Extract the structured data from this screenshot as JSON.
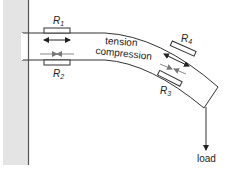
{
  "diagram": {
    "type": "cantilever-beam-strain-gauges",
    "labels": {
      "r1": "R",
      "r1_sub": "1",
      "r2": "R",
      "r2_sub": "2",
      "r3": "R",
      "r3_sub": "3",
      "r4": "R",
      "r4_sub": "4",
      "tension": "tension",
      "compression": "compression",
      "load": "load"
    },
    "colors": {
      "wall_fill": "#e4e4e4",
      "wall_edge": "#555555",
      "beam_stroke": "#333333",
      "tension_arrow": "#222222",
      "compression_arrow": "#888888"
    }
  }
}
